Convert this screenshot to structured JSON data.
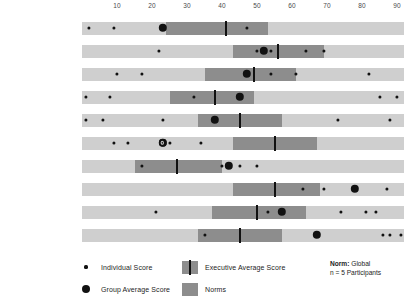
{
  "chart_data": {
    "type": "bar",
    "title": "",
    "subtitle": "",
    "xlabel": "",
    "ylabel": "",
    "xlim": [
      0,
      92
    ],
    "grid": false,
    "legend_position": "bottom",
    "axis_ticks": [
      10,
      20,
      30,
      40,
      50,
      60,
      70,
      80,
      90
    ],
    "categories": [
      "Recognition",
      "Power",
      "Hedonism",
      "Altruistic",
      "Affiliation",
      "Tradition",
      "Security",
      "Commerce",
      "Aesthetics",
      "Science"
    ],
    "values": [
      26,
      57,
      49,
      47,
      41,
      22,
      42,
      83,
      69,
      74
    ],
    "series": [
      {
        "name": "Executive Average Score",
        "values": [
          41,
          56,
          49,
          38,
          45,
          55,
          27,
          55,
          50,
          45
        ]
      },
      {
        "name": "Group Average Score",
        "values": [
          23,
          52,
          47,
          45,
          38,
          23,
          42,
          78,
          57,
          67
        ]
      },
      {
        "name": "Norms",
        "ranges": [
          [
            24,
            53
          ],
          [
            43,
            69
          ],
          [
            35,
            61
          ],
          [
            25,
            49
          ],
          [
            33,
            57
          ],
          [
            43,
            67
          ],
          [
            15,
            40
          ],
          [
            43,
            68
          ],
          [
            37,
            64
          ],
          [
            33,
            57
          ]
        ]
      },
      {
        "name": "Individual Score",
        "points": [
          [
            2,
            9,
            47
          ],
          [
            22,
            50,
            54,
            64,
            69
          ],
          [
            10,
            17,
            54,
            61,
            82
          ],
          [
            1,
            8,
            32,
            85,
            90
          ],
          [
            1,
            6,
            23,
            73,
            88
          ],
          [
            9,
            13,
            23,
            25,
            34
          ],
          [
            17,
            40,
            45,
            50
          ],
          [
            63,
            69,
            87
          ],
          [
            21,
            53,
            74,
            81,
            84
          ],
          [
            35,
            86,
            88,
            91
          ]
        ]
      }
    ],
    "annotations": {
      "group_dot_overlap_rows": [
        "Tradition"
      ]
    }
  },
  "rows": [
    {
      "label": "Recognition",
      "score": "26"
    },
    {
      "label": "Power",
      "score": "57"
    },
    {
      "label": "Hedonism",
      "score": "49"
    },
    {
      "label": "Altruistic",
      "score": "47"
    },
    {
      "label": "Affiliation",
      "score": "41"
    },
    {
      "label": "Tradition",
      "score": "22"
    },
    {
      "label": "Security",
      "score": "42"
    },
    {
      "label": "Commerce",
      "score": "83"
    },
    {
      "label": "Aesthetics",
      "score": "69"
    },
    {
      "label": "Science",
      "score": "74"
    }
  ],
  "legend": {
    "individual_score": "Individual Score",
    "group_average_score": "Group Average Score",
    "executive_average_score": "Executive Average Score",
    "norms": "Norms"
  },
  "norms_note": {
    "label": "Norm:",
    "value": " Global",
    "participants": "n = 5 Participants"
  },
  "colors": {
    "track": "#cfcfcf",
    "norm_band": "#8d8d8d",
    "marker": "#111111",
    "text": "#1a1a1a"
  }
}
